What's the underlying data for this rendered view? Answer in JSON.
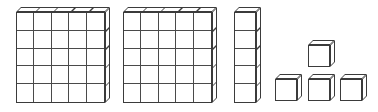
{
  "figure": {
    "background_color": "#ffffff",
    "line_color": "#3b3b3b",
    "inner_line_color": "#4a4a4a",
    "face_color": "#ffffff",
    "canvas": {
      "width": 378,
      "height": 112
    }
  },
  "blocks": [
    {
      "id": "flat-1",
      "label": "Flat 1",
      "kind": "flat",
      "rows": 5,
      "cols": 5,
      "unit_count": 25,
      "x": 16,
      "y": 12,
      "width": 89,
      "height": 91,
      "depth": 5
    },
    {
      "id": "flat-2",
      "label": "Flat 2",
      "kind": "flat",
      "rows": 5,
      "cols": 5,
      "unit_count": 25,
      "x": 123,
      "y": 12,
      "width": 89,
      "height": 91,
      "depth": 5
    },
    {
      "id": "rod-1",
      "label": "Rod",
      "kind": "rod",
      "rows": 5,
      "cols": 1,
      "unit_count": 5,
      "x": 234,
      "y": 12,
      "width": 22,
      "height": 91,
      "depth": 5
    },
    {
      "id": "cube-top",
      "label": "Unit cube",
      "kind": "unit",
      "rows": 1,
      "cols": 1,
      "unit_count": 1,
      "x": 308,
      "y": 45,
      "width": 22,
      "height": 22,
      "depth": 5
    },
    {
      "id": "cube-left",
      "label": "Unit cube",
      "kind": "unit",
      "rows": 1,
      "cols": 1,
      "unit_count": 1,
      "x": 275,
      "y": 79,
      "width": 22,
      "height": 22,
      "depth": 5
    },
    {
      "id": "cube-middle",
      "label": "Unit cube",
      "kind": "unit",
      "rows": 1,
      "cols": 1,
      "unit_count": 1,
      "x": 308,
      "y": 79,
      "width": 22,
      "height": 22,
      "depth": 5
    },
    {
      "id": "cube-right",
      "label": "Unit cube",
      "kind": "unit",
      "rows": 1,
      "cols": 1,
      "unit_count": 1,
      "x": 340,
      "y": 79,
      "width": 22,
      "height": 22,
      "depth": 5
    }
  ],
  "totals": {
    "flats": 2,
    "rods": 1,
    "units": 4,
    "total_unit_cubes": 59
  }
}
